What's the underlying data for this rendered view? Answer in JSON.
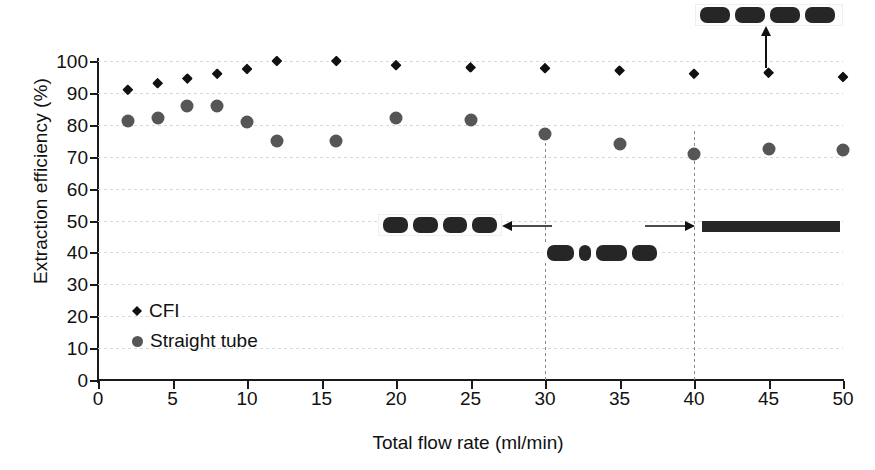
{
  "chart_data": {
    "type": "scatter",
    "title": "",
    "xlabel": "Total flow rate (ml/min)",
    "ylabel": "Extraction efficiency (%)",
    "xlim": [
      0,
      50
    ],
    "ylim": [
      0,
      100
    ],
    "xticks": [
      0,
      5,
      10,
      15,
      20,
      25,
      30,
      35,
      40,
      45,
      50
    ],
    "yticks": [
      0,
      10,
      20,
      30,
      40,
      50,
      60,
      70,
      80,
      90,
      100
    ],
    "grid": "horizontal-dotted",
    "legend_position": "inside-lower-left",
    "series": [
      {
        "name": "CFI",
        "marker": "diamond",
        "color": "#111111",
        "x": [
          2,
          4,
          6,
          8,
          10,
          12,
          16,
          20,
          25,
          30,
          35,
          40,
          45,
          50
        ],
        "y": [
          91,
          93,
          94.5,
          96,
          97.5,
          100,
          100,
          98.7,
          98,
          97.7,
          97,
          96,
          96.3,
          95
        ]
      },
      {
        "name": "Straight tube",
        "marker": "circle",
        "color": "#565656",
        "x": [
          2,
          4,
          6,
          8,
          10,
          12,
          16,
          20,
          25,
          30,
          35,
          40,
          45,
          50
        ],
        "y": [
          81.3,
          82,
          86,
          86,
          81,
          75,
          75,
          82,
          81.5,
          77,
          74,
          70.7,
          72.5,
          72
        ]
      }
    ],
    "dividers": [
      {
        "x": 30,
        "style": "dashed"
      },
      {
        "x": 40,
        "style": "dashed"
      }
    ],
    "annotations": [
      {
        "id": "top-annotation",
        "redacted": true,
        "words": 4,
        "arrow": "up",
        "points_to_x": 45,
        "points_to_y": 96.3
      },
      {
        "id": "left-annotation",
        "redacted": true,
        "words": 4,
        "arrow": "left",
        "points_to_x": 30,
        "y": 48
      },
      {
        "id": "mid-annotation",
        "redacted": true,
        "words": 4,
        "x_range": [
          30,
          39
        ],
        "y": 41
      },
      {
        "id": "right-annotation",
        "redacted": true,
        "words": 1,
        "arrow": "right",
        "points_to_x": 40,
        "y": 47.5
      }
    ]
  },
  "legend": {
    "items": [
      {
        "label": "CFI",
        "marker": "diamond",
        "color": "#111111"
      },
      {
        "label": "Straight tube",
        "marker": "circle",
        "color": "#565656"
      }
    ]
  }
}
